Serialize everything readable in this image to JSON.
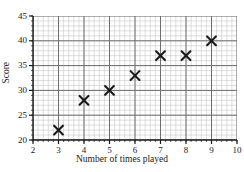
{
  "chart_data": {
    "type": "scatter",
    "title": "",
    "xlabel": "Number of times played",
    "ylabel": "Score",
    "xlim": [
      2,
      10
    ],
    "ylim": [
      20,
      45
    ],
    "xticks": [
      2,
      3,
      4,
      5,
      6,
      7,
      8,
      9,
      10
    ],
    "yticks": [
      20,
      25,
      30,
      35,
      40,
      45
    ],
    "xtick_labels": [
      "2",
      "3",
      "4",
      "5",
      "6",
      "7",
      "8",
      "9",
      "10"
    ],
    "ytick_labels": [
      "20",
      "25",
      "30",
      "35",
      "40",
      "45"
    ],
    "x_major_step": 1,
    "y_major_step": 5,
    "x_minor_per_major": 5,
    "y_minor_per_major": 5,
    "grid": true,
    "grid_minor": true,
    "legend": false,
    "marker": "x",
    "marker_color": "#1a1a1a",
    "points": [
      {
        "x": 3,
        "y": 22
      },
      {
        "x": 4,
        "y": 28
      },
      {
        "x": 5,
        "y": 30
      },
      {
        "x": 6,
        "y": 33
      },
      {
        "x": 7,
        "y": 37
      },
      {
        "x": 8,
        "y": 37
      },
      {
        "x": 9,
        "y": 40
      }
    ],
    "colors": {
      "axis": "#1a1a1a",
      "grid_major": "#6e6e6e",
      "grid_minor": "#c8c8c8",
      "background": "#ffffff",
      "text": "#1a1a1a"
    }
  }
}
